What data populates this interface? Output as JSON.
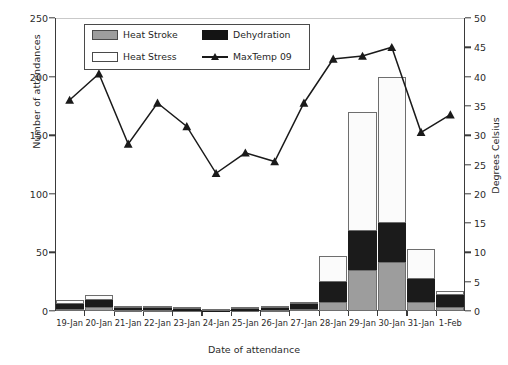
{
  "chart_data": {
    "type": "bar",
    "title": "",
    "xlabel": "Date of attendance",
    "ylabel": "Number of attendances",
    "y2label": "Degrees Celsius",
    "ylim": [
      0,
      250
    ],
    "y2lim": [
      0,
      50
    ],
    "yticks": [
      0,
      50,
      100,
      150,
      200,
      250
    ],
    "y2ticks": [
      0,
      5,
      10,
      15,
      20,
      25,
      30,
      35,
      40,
      45,
      50
    ],
    "grid": false,
    "legend_position": "top-left-inside",
    "categories": [
      "19-Jan",
      "20-Jan",
      "21-Jan",
      "22-Jan",
      "23-Jan",
      "24-Jan",
      "25-Jan",
      "26-Jan",
      "27-Jan",
      "28-Jan",
      "29-Jan",
      "30-Jan",
      "31-Jan",
      "1-Feb"
    ],
    "series": [
      {
        "name": "Heat Stroke",
        "type": "bar-stacked",
        "color": "#9d9d9d",
        "axis": "left",
        "values": [
          2,
          3,
          1,
          1,
          1,
          0,
          1,
          1,
          2,
          8,
          35,
          42,
          8,
          3
        ]
      },
      {
        "name": "Dehydration",
        "type": "bar-stacked",
        "color": "#1b1b1b",
        "axis": "left",
        "values": [
          4,
          6,
          2,
          2,
          1,
          1,
          1,
          2,
          5,
          17,
          33,
          33,
          19,
          11
        ]
      },
      {
        "name": "Heat Stress",
        "type": "bar-stacked",
        "color": "#ffffff",
        "axis": "left",
        "values": [
          3,
          5,
          1,
          1,
          1,
          1,
          1,
          1,
          1,
          22,
          102,
          125,
          26,
          3
        ]
      },
      {
        "name": "MaxTemp 09",
        "type": "line",
        "color": "#1a1a1a",
        "axis": "right",
        "values": [
          36.0,
          40.5,
          28.5,
          35.5,
          31.5,
          23.5,
          27.0,
          25.5,
          35.5,
          43.0,
          43.5,
          45.0,
          30.5,
          33.5
        ]
      }
    ],
    "totals": [
      9,
      14,
      4,
      4,
      3,
      2,
      3,
      4,
      8,
      47,
      170,
      200,
      53,
      17
    ]
  },
  "legend": {
    "items": [
      {
        "label": "Heat Stroke",
        "swatch": "gray-swatch"
      },
      {
        "label": "Dehydration",
        "swatch": "black-swatch"
      },
      {
        "label": "Heat Stress",
        "swatch": "white-swatch"
      },
      {
        "label": "MaxTemp 09",
        "swatch": "line-marker-swatch"
      }
    ]
  }
}
